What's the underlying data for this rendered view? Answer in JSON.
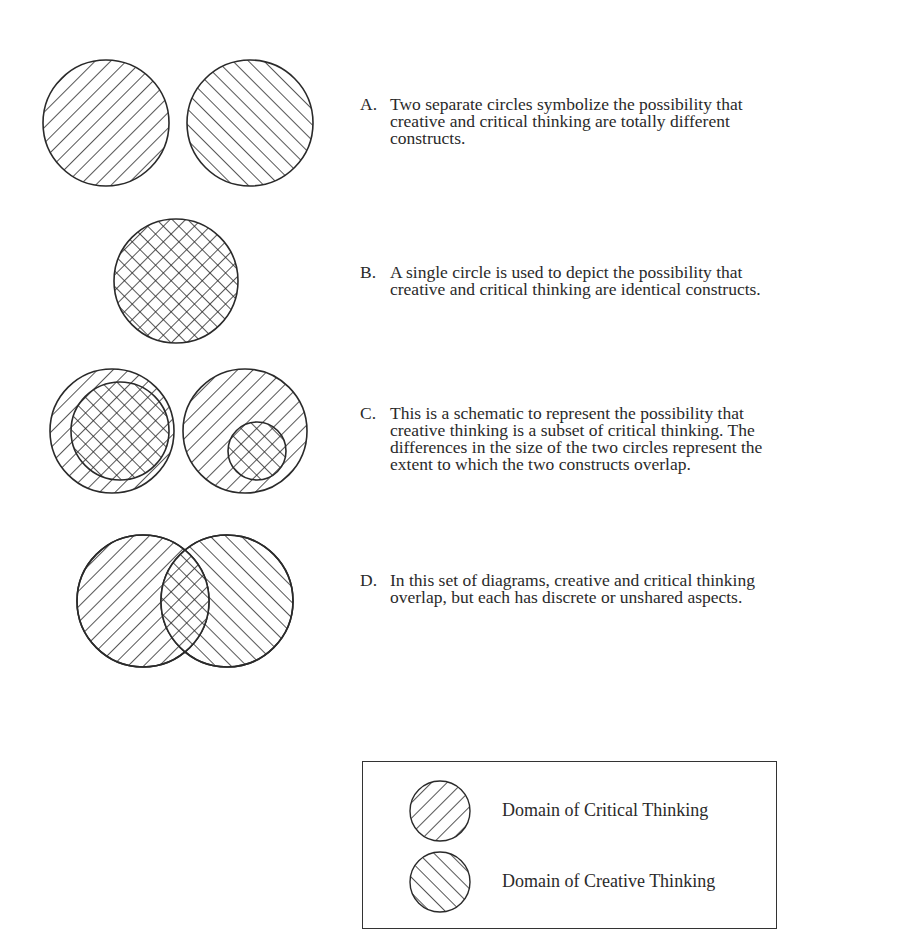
{
  "panels": [
    {
      "id": "A",
      "letter": "A.",
      "lines": [
        "Two separate circles symbolize the possibility that",
        "creative and critical thinking are totally different",
        "constructs."
      ]
    },
    {
      "id": "B",
      "letter": "B.",
      "lines": [
        "A single circle is used to depict the possibility that",
        "creative and critical thinking are identical constructs."
      ]
    },
    {
      "id": "C",
      "letter": "C.",
      "lines": [
        "This is a schematic to represent the possibility that",
        "creative thinking is a subset of critical thinking. The",
        "differences in the size of the two circles represent the",
        "extent to which the two constructs overlap."
      ]
    },
    {
      "id": "D",
      "letter": "D.",
      "lines": [
        "In this set of diagrams, creative and critical thinking",
        "overlap, but each has discrete or unshared aspects."
      ]
    }
  ],
  "legend": {
    "items": [
      {
        "label": "Domain of Critical Thinking",
        "pattern": "hatch-down-right"
      },
      {
        "label": "Domain of Creative Thinking",
        "pattern": "hatch-up-right"
      }
    ]
  },
  "colors": {
    "ink": "#2a2a2a",
    "background": "#ffffff"
  }
}
